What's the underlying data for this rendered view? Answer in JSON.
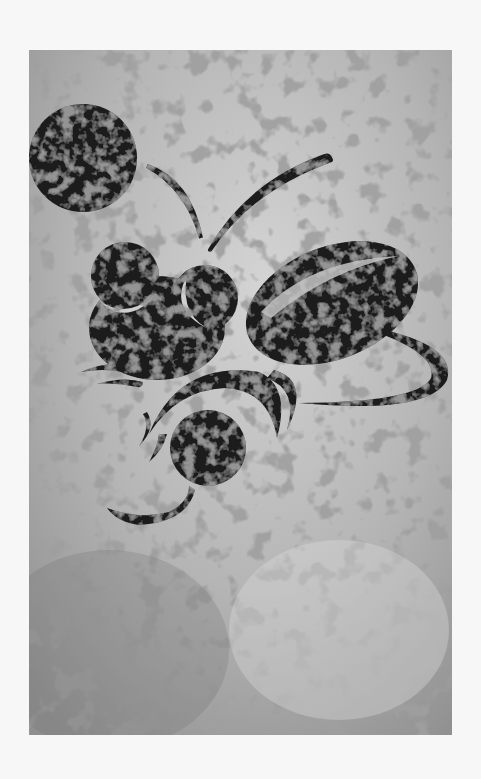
{
  "artwork": {
    "subject": "stylized firefly / insect illustration",
    "style": "black crackle-textured silhouette shapes on grey marbled background",
    "colors": {
      "page_bg": "#f7f7f7",
      "panel_light": "#c9c9c9",
      "panel_mid": "#a9a9a9",
      "panel_dark": "#8e8e8e",
      "ink": "#1c1c1c",
      "ink_texture": "#3a3a3a",
      "crack": "#6d6d6d"
    },
    "elements": [
      "moon-circle",
      "left-antenna",
      "right-antenna",
      "head-eye-left",
      "head-eye-right",
      "body",
      "wing-ellipse",
      "wing-tail-swoosh",
      "leg-arcs",
      "abdomen-glow-circle",
      "tail-curl"
    ]
  }
}
